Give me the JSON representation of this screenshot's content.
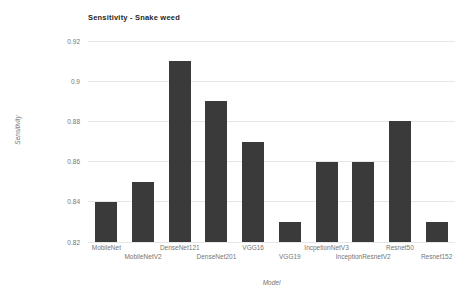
{
  "chart": {
    "colors": {
      "bar": "#3a3a3a",
      "gridline": "#e7e7e7",
      "tick_label": "#757575",
      "title": "#1f1f1f",
      "background": "#ffffff"
    }
  },
  "chart_data": {
    "type": "bar",
    "title": "Sensitivity - Snake weed",
    "xlabel": "Model",
    "ylabel": "Sensitivity",
    "categories": [
      "MobileNet",
      "MobileNetV2",
      "DenseNet121",
      "DenseNet201",
      "VGG16",
      "VGG19",
      "IncpetionNetV3",
      "InceptionResnetV2",
      "Resnet50",
      "Resnet152"
    ],
    "values": [
      0.84,
      0.85,
      0.91,
      0.89,
      0.87,
      0.83,
      0.86,
      0.86,
      0.88,
      0.83
    ],
    "ylim": [
      0.82,
      0.92
    ],
    "yticks": [
      {
        "value": 0.82,
        "label": "0.82"
      },
      {
        "value": 0.84,
        "label": "0.84"
      },
      {
        "value": 0.86,
        "label": "0.86"
      },
      {
        "value": 0.88,
        "label": "0.88"
      },
      {
        "value": 0.9,
        "label": "0.9"
      },
      {
        "value": 0.92,
        "label": "0.92"
      }
    ],
    "grid": true,
    "legend": false,
    "x_tick_labels_staggered": true
  }
}
